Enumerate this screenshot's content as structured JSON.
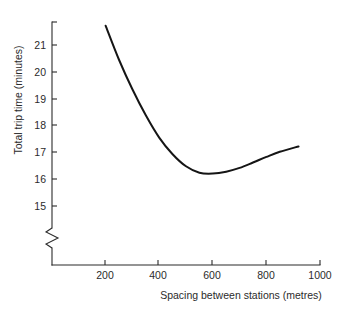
{
  "chart_data": {
    "type": "line",
    "title": "",
    "xlabel": "Spacing between stations (metres)",
    "ylabel": "Total trip time (minutes)",
    "xlim": [
      0,
      1000
    ],
    "ylim": [
      14.6,
      22.0
    ],
    "grid": false,
    "legend": null,
    "axis_break": {
      "axis": "y",
      "below": 15,
      "symbol": "zigzag"
    },
    "xticks": [
      200,
      400,
      600,
      800,
      1000
    ],
    "xtick_labels": [
      "200",
      "400",
      "600",
      "800",
      "1000"
    ],
    "yticks": [
      15,
      16,
      17,
      18,
      19,
      20,
      21
    ],
    "ytick_labels": [
      "15",
      "16",
      "17",
      "18",
      "19",
      "20",
      "21"
    ],
    "series": [
      {
        "name": "Total trip time",
        "color": "#151515",
        "x": [
          200,
          250,
          300,
          350,
          400,
          450,
          500,
          550,
          600,
          650,
          700,
          750,
          800,
          850,
          920
        ],
        "y": [
          21.72,
          20.45,
          19.35,
          18.38,
          17.55,
          16.93,
          16.48,
          16.24,
          16.21,
          16.28,
          16.42,
          16.62,
          16.83,
          17.02,
          17.22
        ]
      }
    ],
    "annotations": [],
    "minimum_point": {
      "x": 580,
      "y": 16.2
    }
  },
  "axis_labels": {
    "y_title": "Total trip time (minutes)",
    "x_title": "Spacing between stations (metres)"
  }
}
